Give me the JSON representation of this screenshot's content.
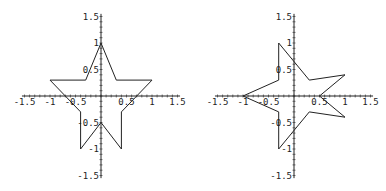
{
  "chart_data": [
    {
      "type": "line",
      "title": "",
      "xlabel": "",
      "ylabel": "",
      "xlim": [
        -1.5,
        1.5
      ],
      "ylim": [
        -1.5,
        1.5
      ],
      "xticks": [
        "-1.5",
        "-1",
        "-0.5",
        "0.5",
        "1",
        "1.5"
      ],
      "yticks": [
        "1.5",
        "1",
        "0.5",
        "-0.5",
        "-1",
        "-1.5"
      ],
      "grid": false,
      "series": [
        {
          "name": "star",
          "points": [
            [
              0,
              1
            ],
            [
              0.3,
              0.3
            ],
            [
              1,
              0.3
            ],
            [
              0.4,
              -0.3
            ],
            [
              0.4,
              -1
            ],
            [
              0,
              -0.5
            ],
            [
              -0.4,
              -1
            ],
            [
              -0.4,
              -0.3
            ],
            [
              -1,
              0.3
            ],
            [
              -0.3,
              0.3
            ],
            [
              0,
              1
            ]
          ]
        }
      ]
    },
    {
      "type": "line",
      "title": "",
      "xlabel": "",
      "ylabel": "",
      "xlim": [
        -1.5,
        1.5
      ],
      "ylim": [
        -1.5,
        1.5
      ],
      "xticks": [
        "-1.5",
        "-1",
        "-0.5",
        "0.5",
        "1",
        "1.5"
      ],
      "yticks": [
        "1.5",
        "1",
        "0.5",
        "-0.5",
        "-1",
        "-1.5"
      ],
      "grid": false,
      "series": [
        {
          "name": "rotated-star",
          "points": [
            [
              -0.3,
              1
            ],
            [
              -0.3,
              0.3
            ],
            [
              -1,
              0
            ],
            [
              -0.3,
              -0.3
            ],
            [
              -0.3,
              -1
            ],
            [
              0.3,
              -0.3
            ],
            [
              1,
              -0.4
            ],
            [
              0.5,
              0
            ],
            [
              1,
              0.4
            ],
            [
              0.3,
              0.3
            ],
            [
              -0.3,
              1
            ]
          ]
        }
      ]
    }
  ]
}
